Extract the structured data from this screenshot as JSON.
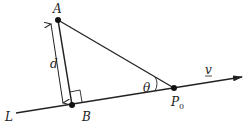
{
  "diagram": {
    "type": "geometry-distance-point-to-line",
    "labels": {
      "point_a": "A",
      "point_b": "B",
      "point_p0": "P",
      "point_p0_subscript": "0",
      "distance": "d",
      "angle": "θ",
      "line": "L",
      "vector": "v"
    },
    "colors": {
      "stroke": "#222222",
      "background": "#ffffff"
    }
  }
}
